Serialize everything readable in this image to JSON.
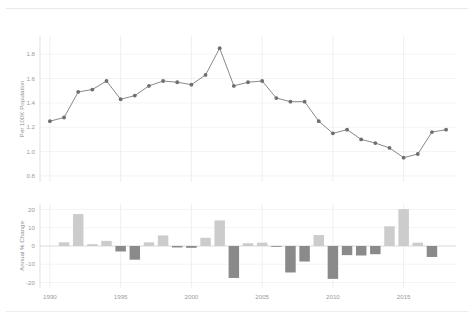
{
  "figure": {
    "background_color": "#ffffff",
    "width": 474,
    "height": 320
  },
  "chart_data": [
    {
      "type": "line",
      "panel": "top",
      "title": "",
      "xlabel": "",
      "ylabel": "Per 100K Population",
      "x": [
        1990,
        1991,
        1992,
        1993,
        1994,
        1995,
        1996,
        1997,
        1998,
        1999,
        2000,
        2001,
        2002,
        2003,
        2004,
        2005,
        2006,
        2007,
        2008,
        2009,
        2010,
        2011,
        2012,
        2013,
        2014,
        2015,
        2016,
        2017,
        2018
      ],
      "values": [
        1.25,
        1.28,
        1.49,
        1.51,
        1.58,
        1.43,
        1.46,
        1.54,
        1.58,
        1.57,
        1.55,
        1.63,
        1.85,
        1.54,
        1.57,
        1.58,
        1.44,
        1.41,
        1.41,
        1.25,
        1.15,
        1.18,
        1.1,
        1.07,
        1.03,
        0.95,
        0.98,
        1.16,
        1.18,
        1.13
      ],
      "series": [
        {
          "name": "Rate per 100K population",
          "color": "#6e6e6e",
          "values": [
            1.25,
            1.28,
            1.49,
            1.51,
            1.58,
            1.43,
            1.46,
            1.54,
            1.58,
            1.57,
            1.55,
            1.63,
            1.85,
            1.54,
            1.57,
            1.58,
            1.44,
            1.41,
            1.41,
            1.25,
            1.15,
            1.18,
            1.1,
            1.07,
            1.03,
            0.95,
            0.98,
            1.16,
            1.18,
            1.13
          ]
        }
      ],
      "ylim": [
        0.75,
        1.95
      ],
      "xlim": [
        1989.3,
        2018.7
      ],
      "yticks": [
        0.8,
        1.0,
        1.2,
        1.4,
        1.6,
        1.8
      ],
      "ytick_labels": [
        "0.8",
        "1.0",
        "1.2",
        "1.4",
        "1.6",
        "1.8"
      ],
      "xticks": [
        1990,
        1995,
        2000,
        2005,
        2010,
        2015
      ],
      "xtick_labels": [
        "1990",
        "1995",
        "2000",
        "2005",
        "2010",
        "2015"
      ],
      "grid": true,
      "legend": "none",
      "marker": "circle"
    },
    {
      "type": "bar",
      "panel": "bottom",
      "title": "",
      "xlabel": "",
      "ylabel": "Annual % Change",
      "categories": [
        1990,
        1991,
        1992,
        1993,
        1994,
        1995,
        1996,
        1997,
        1998,
        1999,
        2000,
        2001,
        2002,
        2003,
        2004,
        2005,
        2006,
        2007,
        2008,
        2009,
        2010,
        2011,
        2012,
        2013,
        2014,
        2015,
        2016,
        2017,
        2018
      ],
      "values": [
        2.0,
        17.5,
        1.0,
        2.8,
        -3.0,
        -7.5,
        2.0,
        5.8,
        -0.8,
        -1.0,
        4.5,
        14.0,
        -17.5,
        1.5,
        1.8,
        -0.4,
        -14.5,
        -8.5,
        6.0,
        -18.0,
        -5.0,
        -5.2,
        -4.5,
        10.8,
        20.2,
        1.8,
        -6.0
      ],
      "ylim": [
        -23,
        23
      ],
      "yticks": [
        -20,
        -10,
        0,
        10,
        20
      ],
      "ytick_labels": [
        "-20",
        "-10",
        "0",
        "10",
        "20"
      ],
      "xticks": [
        1990,
        1995,
        2000,
        2005,
        2010,
        2015
      ],
      "xtick_labels": [
        "1990",
        "1995",
        "2000",
        "2005",
        "2010",
        "2015"
      ],
      "positive_color": "#cccccc",
      "negative_color": "#8a8a8a",
      "grid": true,
      "legend": "none"
    }
  ]
}
